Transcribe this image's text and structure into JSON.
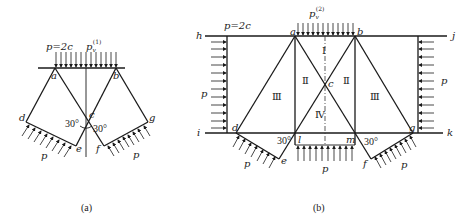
{
  "figure_a": {
    "caption": "(a)",
    "top_load_label": "p=2c",
    "pv_label": "p",
    "pv_sub": "v",
    "pv_sup": "(1)",
    "points": {
      "a": "a",
      "b": "b",
      "c": "c",
      "d": "d",
      "e": "e",
      "f": "f",
      "g": "g"
    },
    "angle_left": "30°",
    "angle_right": "30°",
    "p_left": "p",
    "p_right": "p"
  },
  "figure_b": {
    "caption": "(b)",
    "top_load_label": "p=2c",
    "pv_label": "p",
    "pv_sub": "v",
    "pv_sup": "(2)",
    "points": {
      "a": "a",
      "b": "b",
      "c": "c",
      "d": "d",
      "e": "e",
      "f": "f",
      "g": "g",
      "h": "h",
      "i": "i",
      "j": "j",
      "k": "k",
      "l": "l",
      "m": "m"
    },
    "regions": {
      "I": "Ⅰ",
      "II_left": "Ⅱ",
      "II_right": "Ⅱ",
      "III_left": "Ⅲ",
      "III_right": "Ⅲ",
      "IV": "Ⅳ"
    },
    "angle_left": "30°",
    "angle_right": "30°",
    "p_left_wall": "p",
    "p_right_wall": "p",
    "p_bottom": "p",
    "p_left_slope": "p",
    "p_right_slope": "p"
  }
}
